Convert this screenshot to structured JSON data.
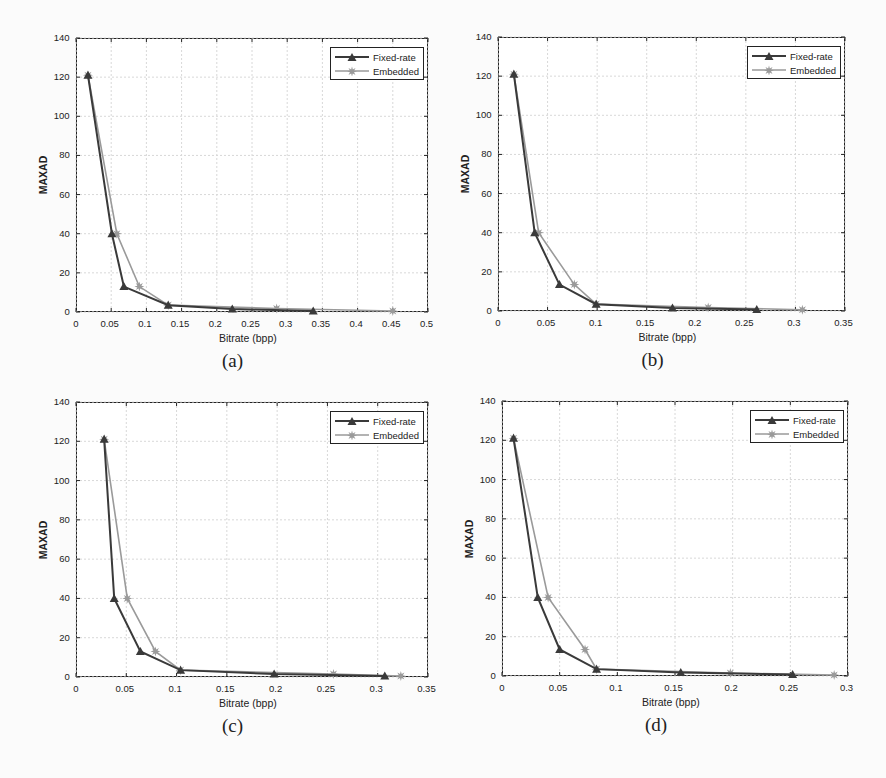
{
  "figure": {
    "panels": [
      {
        "id": "a",
        "caption": "(a)",
        "xlabel": "Bitrate (bpp)",
        "ylabel": "MAXAD",
        "xticks": [
          "0",
          "0.05",
          "0.1",
          "0.15",
          "0.2",
          "0.25",
          "0.3",
          "0.35",
          "0.4",
          "0.45",
          "0.5"
        ],
        "yticks": [
          "0",
          "20",
          "40",
          "60",
          "80",
          "100",
          "120",
          "140"
        ],
        "legend": [
          "Fixed-rate",
          "Embedded"
        ]
      },
      {
        "id": "b",
        "caption": "(b)",
        "xlabel": "Bitrate (bpp)",
        "ylabel": "MAXAD",
        "xticks": [
          "0",
          "0.05",
          "0.1",
          "0.15",
          "0.2",
          "0.25",
          "0.3",
          "0.35"
        ],
        "yticks": [
          "0",
          "20",
          "40",
          "60",
          "80",
          "100",
          "120",
          "140"
        ],
        "legend": [
          "Fixed-rate",
          "Embedded"
        ]
      },
      {
        "id": "c",
        "caption": "(c)",
        "xlabel": "Bitrate (bpp)",
        "ylabel": "MAXAD",
        "xticks": [
          "0",
          "0.05",
          "0.1",
          "0.15",
          "0.2",
          "0.25",
          "0.3",
          "0.35"
        ],
        "yticks": [
          "0",
          "20",
          "40",
          "60",
          "80",
          "100",
          "120",
          "140"
        ],
        "legend": [
          "Fixed-rate",
          "Embedded"
        ]
      },
      {
        "id": "d",
        "caption": "(d)",
        "xlabel": "Bitrate (bpp)",
        "ylabel": "MAXAD",
        "xticks": [
          "0",
          "0.05",
          "0.1",
          "0.15",
          "0.2",
          "0.25",
          "0.3"
        ],
        "yticks": [
          "0",
          "20",
          "40",
          "60",
          "80",
          "100",
          "120",
          "140"
        ],
        "legend": [
          "Fixed-rate",
          "Embedded"
        ]
      }
    ]
  },
  "colors": {
    "fixed_rate": "#3a3a3a",
    "embedded": "#9a9a9a",
    "grid": "#d8d8d8",
    "axis": "#222222"
  },
  "chart_data": [
    {
      "type": "line",
      "title": "(a)",
      "xlabel": "Bitrate (bpp)",
      "ylabel": "MAXAD",
      "xlim": [
        0,
        0.5
      ],
      "ylim": [
        0,
        140
      ],
      "grid": true,
      "legend_position": "upper right",
      "series": [
        {
          "name": "Fixed-rate",
          "marker": "triangle",
          "x": [
            0.017,
            0.051,
            0.068,
            0.131,
            0.222,
            0.337
          ],
          "y": [
            121,
            40,
            13,
            3.5,
            1.5,
            0.5
          ]
        },
        {
          "name": "Embedded",
          "marker": "star",
          "x": [
            0.017,
            0.058,
            0.09,
            0.131,
            0.285,
            0.45
          ],
          "y": [
            121,
            40,
            13,
            3.5,
            1.8,
            0.5
          ]
        }
      ]
    },
    {
      "type": "line",
      "title": "(b)",
      "xlabel": "Bitrate (bpp)",
      "ylabel": "MAXAD",
      "xlim": [
        0,
        0.35
      ],
      "ylim": [
        0,
        140
      ],
      "grid": true,
      "legend_position": "upper right",
      "series": [
        {
          "name": "Fixed-rate",
          "marker": "triangle",
          "x": [
            0.016,
            0.037,
            0.062,
            0.099,
            0.176,
            0.261
          ],
          "y": [
            121,
            40,
            13.5,
            3.5,
            1.5,
            0.8
          ]
        },
        {
          "name": "Embedded",
          "marker": "star",
          "x": [
            0.016,
            0.041,
            0.077,
            0.099,
            0.212,
            0.307
          ],
          "y": [
            121,
            40,
            13.5,
            3.5,
            1.8,
            0.6
          ]
        }
      ]
    },
    {
      "type": "line",
      "title": "(c)",
      "xlabel": "Bitrate (bpp)",
      "ylabel": "MAXAD",
      "xlim": [
        0,
        0.35
      ],
      "ylim": [
        0,
        140
      ],
      "grid": true,
      "legend_position": "upper right",
      "series": [
        {
          "name": "Fixed-rate",
          "marker": "triangle",
          "x": [
            0.028,
            0.038,
            0.064,
            0.104,
            0.197,
            0.307
          ],
          "y": [
            121,
            40,
            13,
            3.5,
            1.5,
            0.5
          ]
        },
        {
          "name": "Embedded",
          "marker": "star",
          "x": [
            0.028,
            0.051,
            0.079,
            0.104,
            0.256,
            0.323
          ],
          "y": [
            121,
            40,
            13,
            3.5,
            1.5,
            0.5
          ]
        }
      ]
    },
    {
      "type": "line",
      "title": "(d)",
      "xlabel": "Bitrate (bpp)",
      "ylabel": "MAXAD",
      "xlim": [
        0,
        0.3
      ],
      "ylim": [
        0,
        140
      ],
      "grid": true,
      "legend_position": "upper right",
      "series": [
        {
          "name": "Fixed-rate",
          "marker": "triangle",
          "x": [
            0.01,
            0.031,
            0.05,
            0.082,
            0.155,
            0.252
          ],
          "y": [
            121,
            40,
            13.5,
            3.5,
            1.8,
            0.8
          ]
        },
        {
          "name": "Embedded",
          "marker": "star",
          "x": [
            0.01,
            0.04,
            0.072,
            0.082,
            0.198,
            0.288
          ],
          "y": [
            121,
            40,
            13.5,
            3.5,
            1.5,
            0.5
          ]
        }
      ]
    }
  ]
}
